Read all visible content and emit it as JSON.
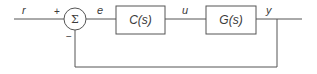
{
  "diagram": {
    "type": "feedback-control-block-diagram",
    "signals": {
      "reference": "r",
      "error": "e",
      "control": "u",
      "output": "y"
    },
    "summing_junction": {
      "symbol": "Σ",
      "plus_sign": "+",
      "minus_sign": "−"
    },
    "blocks": [
      {
        "id": "controller",
        "label": "C(s)"
      },
      {
        "id": "plant",
        "label": "G(s)"
      }
    ],
    "colors": {
      "line": "#555555",
      "text": "#3a3a3a",
      "background": "#ffffff"
    }
  }
}
